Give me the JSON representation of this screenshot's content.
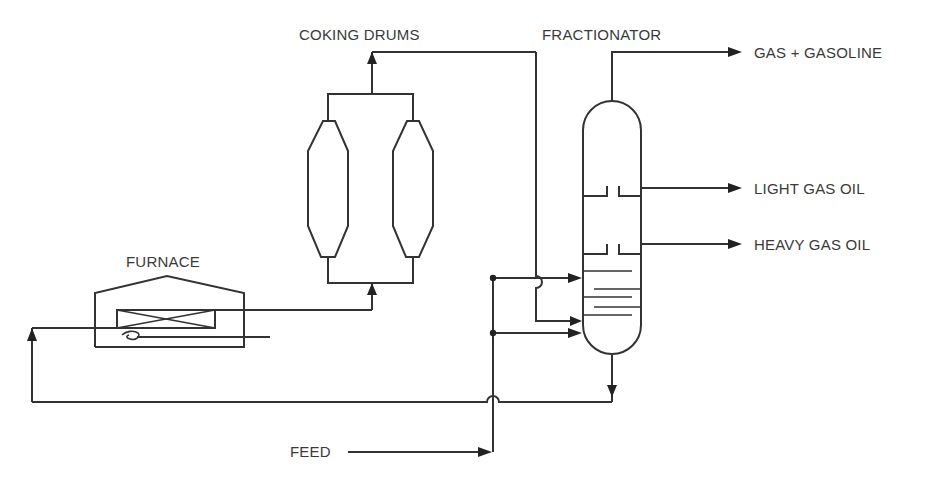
{
  "diagram": {
    "type": "process-flow-diagram",
    "colors": {
      "line": "#333333",
      "text": "#3a3a3a",
      "background": "#ffffff"
    }
  },
  "labels": {
    "coking_drums": "COKING DRUMS",
    "fractionator": "FRACTIONATOR",
    "furnace": "FURNACE",
    "feed": "FEED",
    "gas_gasoline": "GAS + GASOLINE",
    "light_gas_oil": "LIGHT GAS OIL",
    "heavy_gas_oil": "HEAVY GAS OIL"
  },
  "nodes": [
    {
      "id": "furnace",
      "label": "FURNACE"
    },
    {
      "id": "coking-drum-1",
      "label": "COKING DRUMS"
    },
    {
      "id": "coking-drum-2",
      "label": "COKING DRUMS"
    },
    {
      "id": "fractionator",
      "label": "FRACTIONATOR"
    }
  ],
  "edges": [
    {
      "from": "feed",
      "to": "fractionator",
      "note": "feed splits to two lower fractionator inlets"
    },
    {
      "from": "fractionator",
      "to": "furnace",
      "note": "bottoms recycle to furnace"
    },
    {
      "from": "furnace",
      "to": "coking-drums"
    },
    {
      "from": "coking-drums",
      "to": "fractionator",
      "note": "drum overhead vapors"
    },
    {
      "from": "fractionator",
      "to": "gas + gasoline"
    },
    {
      "from": "fractionator",
      "to": "light gas oil"
    },
    {
      "from": "fractionator",
      "to": "heavy gas oil"
    }
  ]
}
